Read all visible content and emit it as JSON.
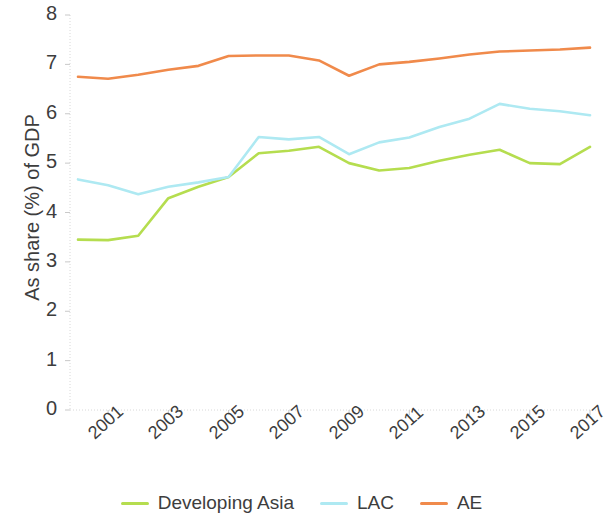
{
  "chart_data": {
    "type": "line",
    "title": "",
    "xlabel": "",
    "ylabel": "As share (%) of GDP",
    "ylim": [
      0,
      8
    ],
    "xlim": [
      2000,
      2017
    ],
    "grid": false,
    "legend_position": "bottom",
    "y_ticks": [
      8,
      7,
      6,
      5,
      4,
      3,
      2,
      1,
      0
    ],
    "x_ticks": [
      2001,
      2003,
      2005,
      2007,
      2009,
      2011,
      2013,
      2015,
      2017
    ],
    "x": [
      2000,
      2001,
      2002,
      2003,
      2004,
      2005,
      2006,
      2007,
      2008,
      2009,
      2010,
      2011,
      2012,
      2013,
      2014,
      2015,
      2016,
      2017
    ],
    "series": [
      {
        "name": "Developing Asia",
        "color": "#b5dd4f",
        "values": [
          3.45,
          3.44,
          3.53,
          4.29,
          4.52,
          4.72,
          5.2,
          5.25,
          5.33,
          5.0,
          4.85,
          4.9,
          5.05,
          5.17,
          5.27,
          5.0,
          4.98,
          5.33
        ]
      },
      {
        "name": "LAC",
        "color": "#aee9f2",
        "values": [
          4.67,
          4.55,
          4.37,
          4.52,
          4.61,
          4.72,
          5.53,
          5.48,
          5.53,
          5.18,
          5.42,
          5.52,
          5.73,
          5.9,
          6.2,
          6.1,
          6.05,
          5.97
        ]
      },
      {
        "name": "AE",
        "color": "#f08a4b",
        "values": [
          6.75,
          6.71,
          6.79,
          6.89,
          6.97,
          7.17,
          7.18,
          7.18,
          7.08,
          6.77,
          7.0,
          7.05,
          7.12,
          7.2,
          7.26,
          7.28,
          7.3,
          7.34
        ]
      }
    ]
  }
}
